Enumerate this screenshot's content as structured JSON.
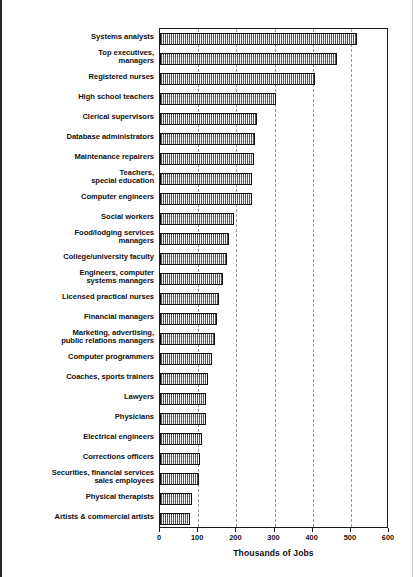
{
  "figure": {
    "axis_title": "Thousands of Jobs",
    "source_caption": ""
  },
  "chart_data": {
    "type": "bar",
    "orientation": "horizontal",
    "title": "",
    "xlabel": "Thousands of Jobs",
    "ylabel": "",
    "xlim": [
      0,
      600
    ],
    "xticks": [
      0,
      100,
      200,
      300,
      400,
      500,
      600
    ],
    "xtick_labels": [
      "0",
      "100",
      "200",
      "300",
      "400",
      "500",
      "600"
    ],
    "grid": "vertical dashed gridlines at each 100 interval",
    "legend": "none",
    "units": "thousands of jobs",
    "categories": [
      "Systems analysts",
      "Top executives,\nmanagers",
      "Registered nurses",
      "High school teachers",
      "Clerical supervisors",
      "Database administrators",
      "Maintenance repairers",
      "Teachers,\nspecial education",
      "Computer engineers",
      "Social workers",
      "Food/lodging services\nmanagers",
      "College/university faculty",
      "Engineers, computer\nsystems managers",
      "Licensed practical nurses",
      "Financial managers",
      "Marketing, advertising,\npublic relations managers",
      "Computer programmers",
      "Coaches, sports trainers",
      "Lawyers",
      "Physicians",
      "Electrical engineers",
      "Corrections officers",
      "Securities, financial services\nsales employees",
      "Physical therapists",
      "Artists & commercial artists"
    ],
    "values": [
      515,
      465,
      405,
      305,
      255,
      250,
      245,
      240,
      240,
      195,
      180,
      175,
      165,
      155,
      150,
      145,
      135,
      125,
      120,
      120,
      110,
      105,
      103,
      85,
      78
    ]
  }
}
